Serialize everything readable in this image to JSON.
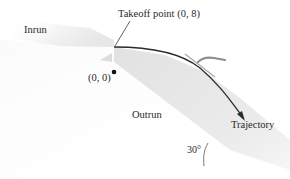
{
  "diagram": {
    "labels": {
      "inrun": "Inrun",
      "takeoff": "Takeoff point (0, 8)",
      "origin": "(0, 0)",
      "outrun": "Outrun",
      "trajectory": "Trajectory",
      "angle": "30°"
    },
    "points": {
      "takeoff": {
        "x": 0,
        "y": 8
      },
      "origin": {
        "x": 0,
        "y": 0
      }
    },
    "slope_angle_degrees": 30,
    "colors": {
      "slope_fill": "#e6e6e6",
      "trajectory_line": "#2b2b2b",
      "leader_line": "#3a3a3a",
      "skier": "#9a9a9a",
      "text": "#2a2a2a"
    }
  }
}
